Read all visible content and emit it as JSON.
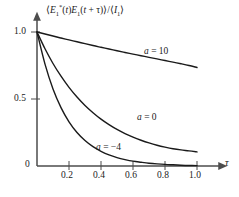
{
  "figure": {
    "background": "#ffffff",
    "axis_color": "#4d4d4d",
    "curve_color": "#1a1a1a"
  },
  "axes": {
    "y_axis_label": "⟨E₁*(t)E₁(t + τ)⟩/⟨I₁⟩",
    "x_axis_label": "τ",
    "y_ticks": [
      "1.0",
      "0.5",
      "0"
    ],
    "x_ticks": [
      "0.2",
      "0.4",
      "0.6",
      "0.8",
      "1.0"
    ]
  },
  "curve_labels": [
    {
      "id": "a10",
      "text": "a = 10"
    },
    {
      "id": "a0",
      "text": "a = 0"
    },
    {
      "id": "am4",
      "text": "a = −4"
    }
  ],
  "chart_data": {
    "type": "line",
    "title": "",
    "xlabel": "τ",
    "ylabel": "⟨E₁*(t)E₁(t + τ)⟩/⟨I₁⟩",
    "xlim": [
      0,
      1.0
    ],
    "ylim": [
      0,
      1.0
    ],
    "xticks": [
      0.2,
      0.4,
      0.6,
      0.8,
      1.0
    ],
    "yticks": [
      0,
      0.5,
      1.0
    ],
    "grid": false,
    "legend": "inline-annotations",
    "x": [
      0.0,
      0.05,
      0.1,
      0.15,
      0.2,
      0.25,
      0.3,
      0.35,
      0.4,
      0.45,
      0.5,
      0.55,
      0.6,
      0.65,
      0.7,
      0.75,
      0.8,
      0.85,
      0.9,
      0.95,
      1.0
    ],
    "series": [
      {
        "name": "a = 10",
        "label": "a = 10",
        "values": [
          1.0,
          0.985,
          0.97,
          0.955,
          0.941,
          0.927,
          0.913,
          0.899,
          0.886,
          0.873,
          0.86,
          0.847,
          0.835,
          0.823,
          0.811,
          0.799,
          0.787,
          0.775,
          0.763,
          0.75,
          0.735
        ]
      },
      {
        "name": "a = 0",
        "label": "a = 0",
        "values": [
          1.0,
          0.875,
          0.765,
          0.67,
          0.587,
          0.515,
          0.452,
          0.398,
          0.35,
          0.309,
          0.273,
          0.242,
          0.215,
          0.192,
          0.172,
          0.155,
          0.141,
          0.129,
          0.12,
          0.113,
          0.105
        ]
      },
      {
        "name": "a = -4",
        "label": "a = −4",
        "values": [
          1.0,
          0.76,
          0.575,
          0.436,
          0.33,
          0.25,
          0.19,
          0.144,
          0.11,
          0.083,
          0.063,
          0.048,
          0.036,
          0.028,
          0.021,
          0.016,
          0.012,
          0.009,
          0.006,
          0.004,
          0.003
        ]
      }
    ]
  }
}
